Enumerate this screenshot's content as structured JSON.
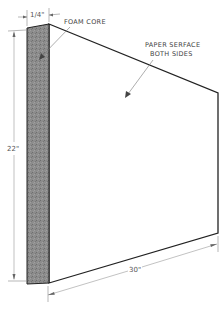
{
  "diagram": {
    "labels": {
      "foam_core": "FOAM CORE",
      "paper_surface_line1": "PAPER SERFACE",
      "paper_surface_line2": "BOTH SIDES"
    },
    "dimensions": {
      "thickness": "1/4\"",
      "height": "22\"",
      "width": "30\""
    },
    "colors": {
      "foam_core_fill": "#8a8a8a",
      "outline": "#222222",
      "dimension_line": "#888888"
    }
  }
}
